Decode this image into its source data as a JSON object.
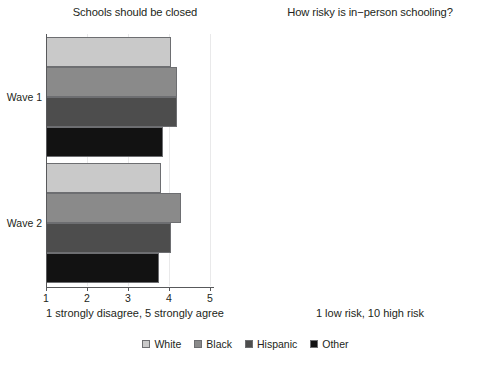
{
  "figure": {
    "background": "#ffffff"
  },
  "legend": {
    "position": "bottom-center",
    "items": [
      {
        "label": "White",
        "color": "#c9c9c9"
      },
      {
        "label": "Black",
        "color": "#8a8a8a"
      },
      {
        "label": "Hispanic",
        "color": "#4d4d4d"
      },
      {
        "label": "Other",
        "color": "#121212"
      }
    ]
  },
  "panels": [
    {
      "id": "schools-should-be-closed",
      "title": "Schools should be closed",
      "xlabel": "1 strongly disagree, 5 strongly agree",
      "ticklabels": [
        "1",
        "2",
        "3",
        "4",
        "5"
      ],
      "groups": [
        "Wave 1",
        "Wave 2"
      ]
    },
    {
      "id": "how-risky-is-in-person-schooling",
      "title": "How risky is in−person schooling?",
      "xlabel": "1 low risk, 10 high risk",
      "ticklabels": [
        "1",
        "2",
        "3",
        "4",
        "5",
        "6",
        "7",
        "8",
        "9",
        "10"
      ],
      "groups": [
        "Wave 4"
      ]
    }
  ],
  "chart_data": [
    {
      "type": "bar",
      "orientation": "horizontal",
      "title": "Schools should be closed",
      "xlabel": "1 strongly disagree, 5 strongly agree",
      "ylabel": "",
      "xlim": [
        1,
        5
      ],
      "xticks": [
        1,
        2,
        3,
        4,
        5
      ],
      "grid": "vertical",
      "categories": [
        "Wave 1",
        "Wave 2"
      ],
      "series": [
        {
          "name": "White",
          "color": "#c9c9c9",
          "values": [
            4.05,
            3.8
          ]
        },
        {
          "name": "Black",
          "color": "#8a8a8a",
          "values": [
            4.2,
            4.3
          ]
        },
        {
          "name": "Hispanic",
          "color": "#4d4d4d",
          "values": [
            4.2,
            4.05
          ]
        },
        {
          "name": "Other",
          "color": "#121212",
          "values": [
            3.85,
            3.75
          ]
        }
      ]
    },
    {
      "type": "bar",
      "orientation": "horizontal",
      "title": "How risky is in−person schooling?",
      "xlabel": "1 low risk, 10 high risk",
      "ylabel": "",
      "xlim": [
        1,
        10
      ],
      "xticks": [
        1,
        2,
        3,
        4,
        5,
        6,
        7,
        8,
        9,
        10
      ],
      "grid": "vertical",
      "categories": [
        "Wave 4"
      ],
      "series": [
        {
          "name": "White",
          "color": "#c9c9c9",
          "values": [
            6.9
          ]
        },
        {
          "name": "Black",
          "color": "#8a8a8a",
          "values": [
            9.0
          ]
        },
        {
          "name": "Hispanic",
          "color": "#4d4d4d",
          "values": [
            7.8
          ]
        },
        {
          "name": "Other",
          "color": "#121212",
          "values": [
            6.65
          ]
        }
      ]
    }
  ]
}
